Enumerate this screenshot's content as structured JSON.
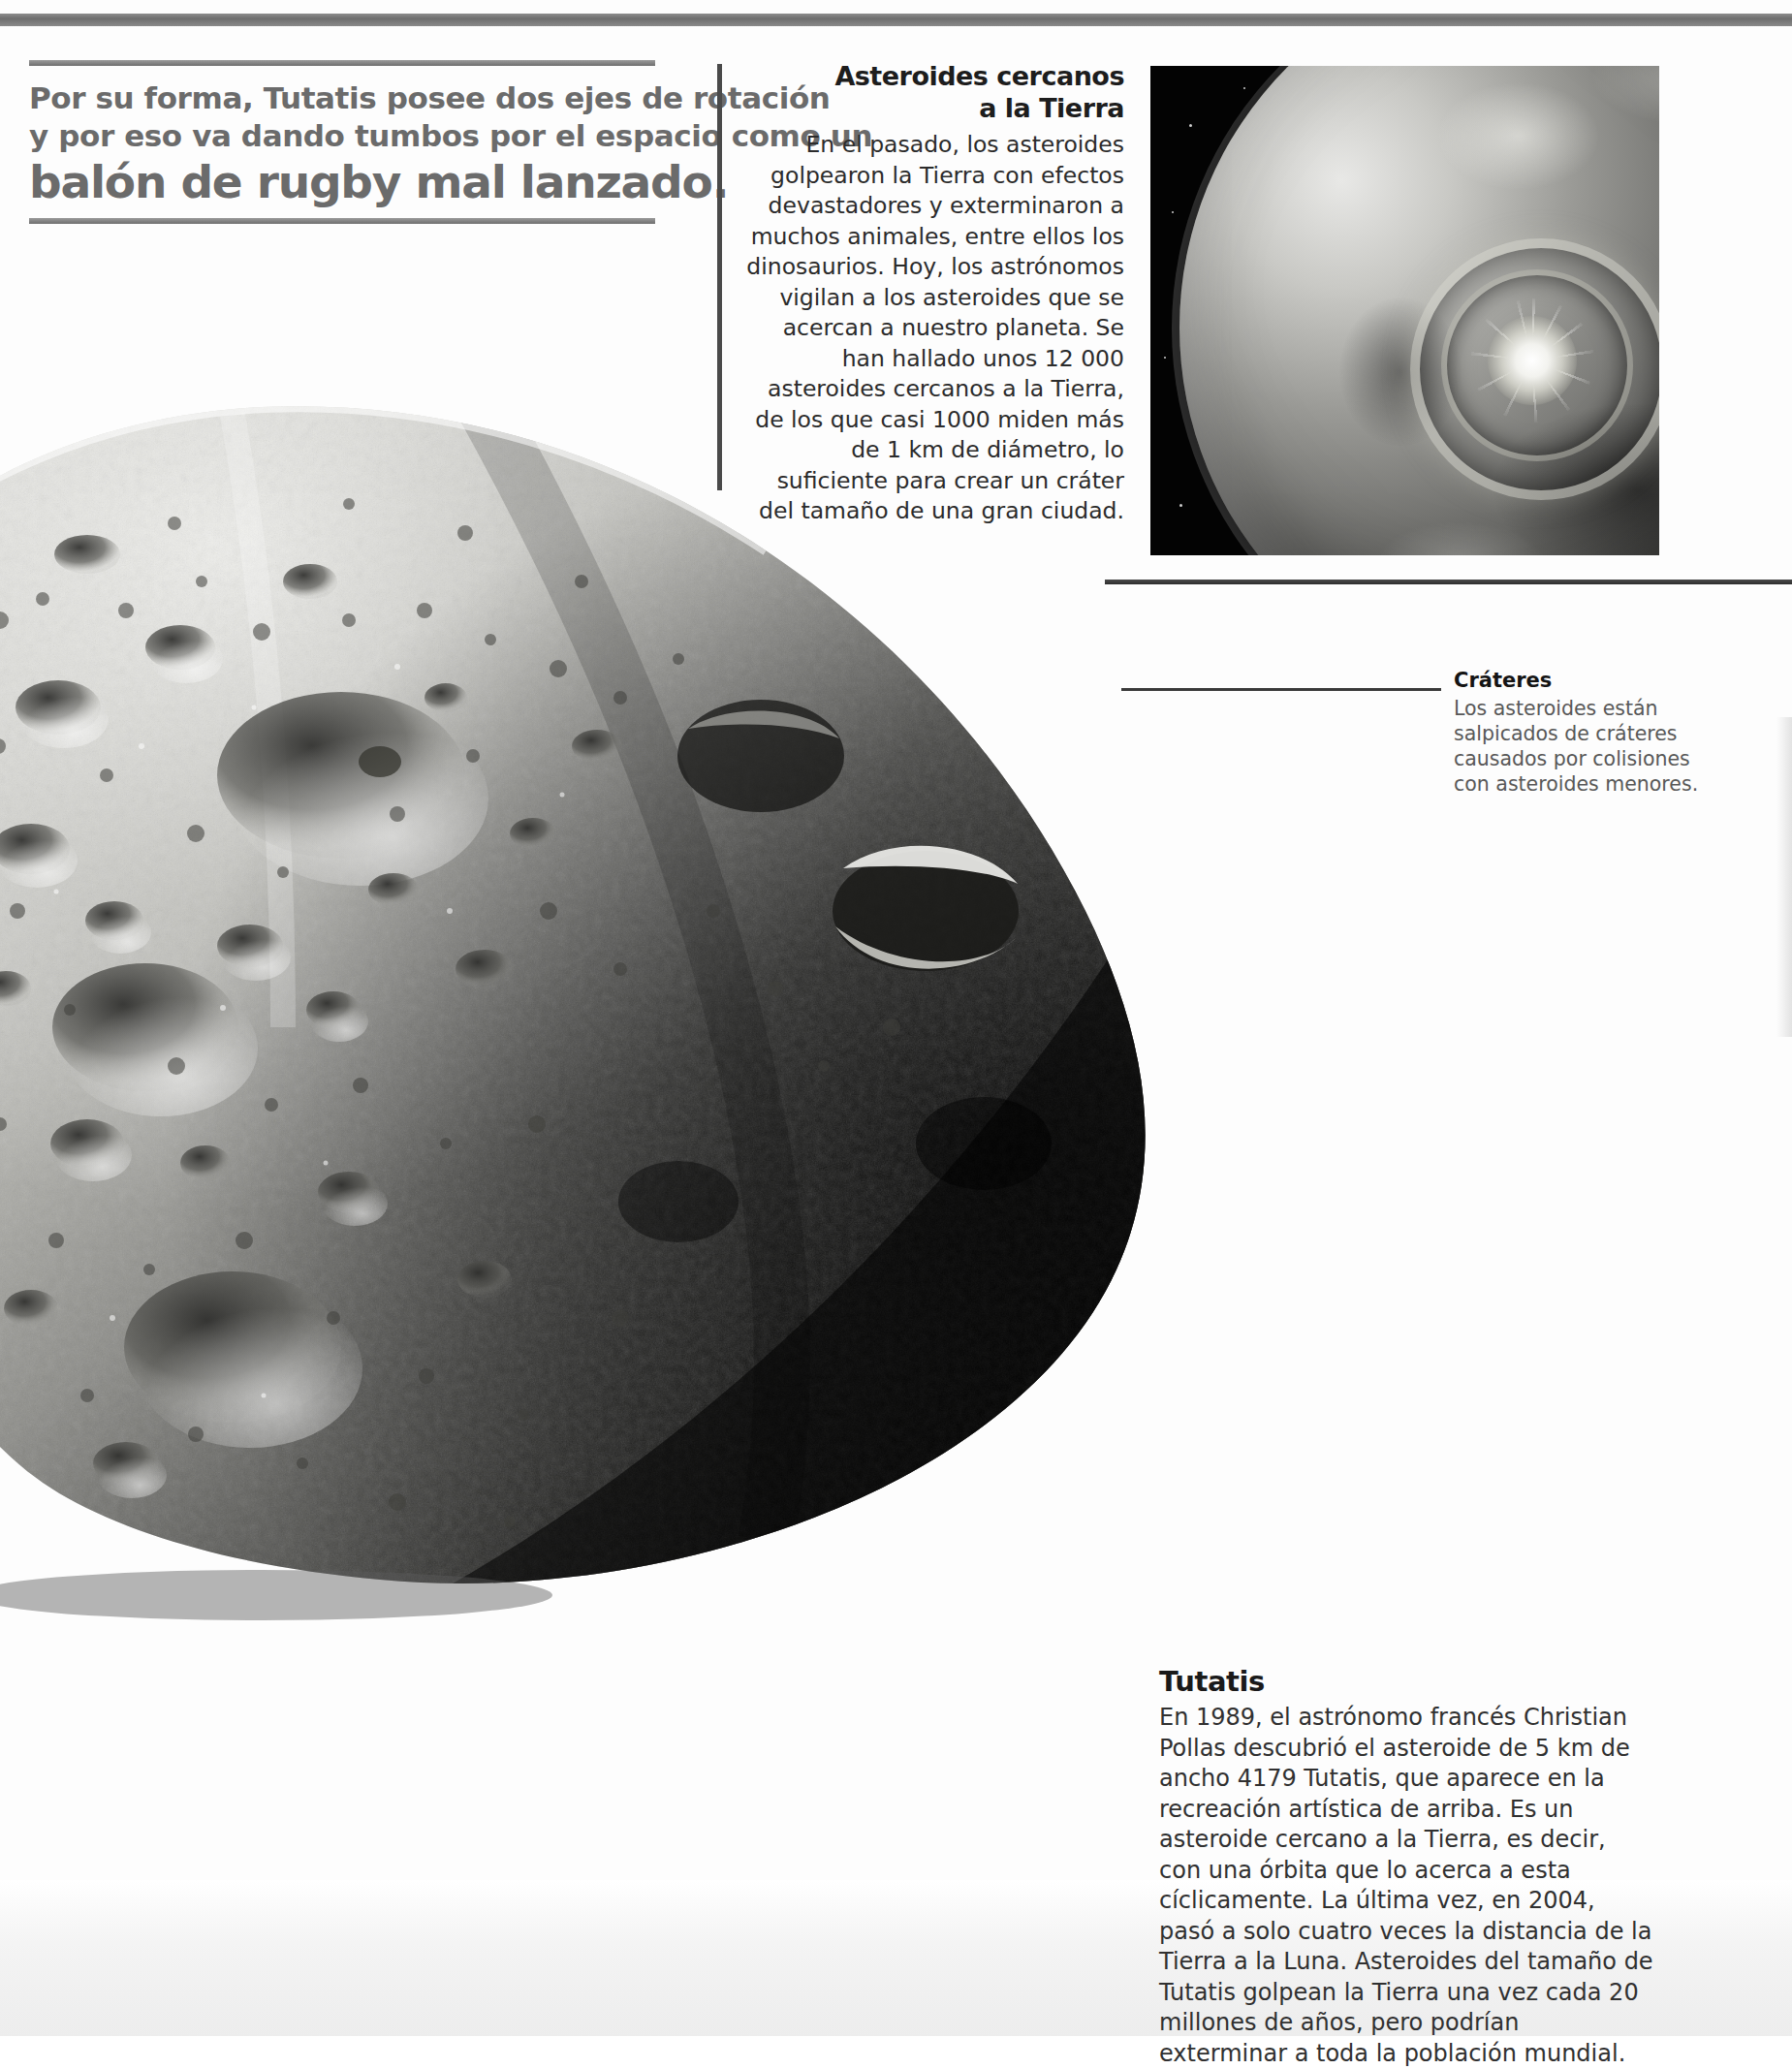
{
  "page": {
    "background_color": "#ffffff",
    "top_rule_color": "#7a7a7a"
  },
  "headline": {
    "line1": "Por su forma, Tutatis posee dos ejes de rotación",
    "line2": "y por eso va dando tumbos por el espacio como un",
    "line3": "balón de rugby mal lanzado.",
    "color": "#6b6b6b"
  },
  "near_earth_column": {
    "title_line1": "Asteroides cercanos",
    "title_line2": "a la Tierra",
    "body": "En el pasado, los asteroides golpearon la Tierra con efectos devastadores y exterminaron a muchos animales, entre ellos los dinosaurios. Hoy, los astrónomos vigilan a los asteroides que se acercan a nuestro planeta. Se han hallado unos 12 000 asteroides cercanos a la Tierra, de los que casi 1000 miden más de 1 km de diámetro, lo suficiente para crear un cráter del tamaño de una gran ciudad.",
    "title_color": "#1d1d1d",
    "body_color": "#2b2b2b"
  },
  "photo": {
    "name": "earth-asteroid-impact-photo",
    "description": "Fotografía en blanco y negro de la Tierra vista desde el espacio con un impacto de asteroide y onda de choque circular",
    "background_color": "#000000"
  },
  "crateres_callout": {
    "title": "Cráteres",
    "body": "Los asteroides están salpicados de cráteres causados por colisiones con asteroides menores.",
    "title_color": "#141414",
    "body_color": "#585858",
    "leader_line_color": "#3a3a3a"
  },
  "tutatis_block": {
    "title": "Tutatis",
    "body": "En 1989, el astrónomo francés Christian Pollas descubrió el asteroide de 5 km de ancho 4179 Tutatis, que aparece en la recreación artística de arriba. Es un asteroide cercano a la Tierra, es decir, con una órbita que lo acerca a esta cíclicamente. La última vez, en 2004, pasó a solo cuatro veces la distancia de la Tierra a la Luna. Asteroides del tamaño de Tutatis golpean la Tierra una vez cada 20 millones de años, pero podrían exterminar a toda la población mundial.",
    "title_color": "#1a1a1a",
    "body_color": "#303030"
  },
  "asteroid_illustration": {
    "name": "tutatis-asteroid-artwork",
    "description": "Recreación artística en blanco y negro del asteroide 4179 Tutatis, superficie cubierta de cráteres, iluminado desde la izquierda y en sombra hacia la derecha"
  }
}
